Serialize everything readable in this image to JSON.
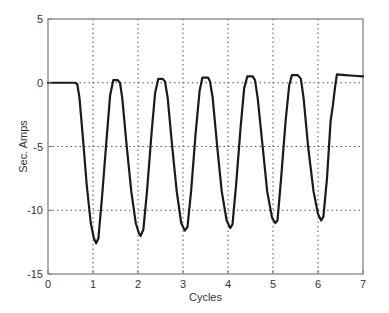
{
  "chart_data": {
    "type": "line",
    "title": "",
    "xlabel": "Cycles",
    "ylabel": "Sec. Amps",
    "xlim": [
      0,
      7
    ],
    "ylim": [
      -15,
      5
    ],
    "xticks": [
      0,
      1,
      2,
      3,
      4,
      5,
      6,
      7
    ],
    "yticks": [
      5,
      0,
      -5,
      -10,
      -15
    ],
    "xtick_labels": [
      "0",
      "1",
      "2",
      "3",
      "4",
      "5",
      "6",
      "7"
    ],
    "ytick_labels": [
      "5",
      "0",
      "-5",
      "-10",
      "-15"
    ],
    "grid": true,
    "grid_style": "dotted",
    "legend": null,
    "series": [
      {
        "name": "Secondary current",
        "color": "#1a1a1a",
        "points": [
          [
            0.0,
            0.0
          ],
          [
            0.6,
            0.0
          ],
          [
            0.65,
            -0.1
          ],
          [
            0.7,
            -1.2
          ],
          [
            0.78,
            -4.5
          ],
          [
            0.86,
            -8.0
          ],
          [
            0.95,
            -11.0
          ],
          [
            1.02,
            -12.2
          ],
          [
            1.07,
            -12.6
          ],
          [
            1.12,
            -12.2
          ],
          [
            1.2,
            -9.0
          ],
          [
            1.3,
            -4.5
          ],
          [
            1.38,
            -1.0
          ],
          [
            1.45,
            0.2
          ],
          [
            1.55,
            0.2
          ],
          [
            1.6,
            0.0
          ],
          [
            1.65,
            -1.2
          ],
          [
            1.75,
            -5.0
          ],
          [
            1.85,
            -8.5
          ],
          [
            1.95,
            -11.0
          ],
          [
            2.02,
            -11.8
          ],
          [
            2.06,
            -12.0
          ],
          [
            2.12,
            -11.5
          ],
          [
            2.2,
            -8.5
          ],
          [
            2.3,
            -4.0
          ],
          [
            2.38,
            -0.8
          ],
          [
            2.45,
            0.3
          ],
          [
            2.55,
            0.3
          ],
          [
            2.6,
            0.1
          ],
          [
            2.66,
            -1.2
          ],
          [
            2.76,
            -5.0
          ],
          [
            2.86,
            -8.5
          ],
          [
            2.96,
            -11.0
          ],
          [
            3.04,
            -11.6
          ],
          [
            3.1,
            -11.3
          ],
          [
            3.18,
            -8.5
          ],
          [
            3.28,
            -4.0
          ],
          [
            3.37,
            -0.6
          ],
          [
            3.43,
            0.4
          ],
          [
            3.56,
            0.4
          ],
          [
            3.6,
            0.1
          ],
          [
            3.66,
            -1.2
          ],
          [
            3.76,
            -5.0
          ],
          [
            3.86,
            -8.5
          ],
          [
            3.97,
            -10.8
          ],
          [
            4.05,
            -11.4
          ],
          [
            4.1,
            -11.1
          ],
          [
            4.18,
            -8.0
          ],
          [
            4.28,
            -3.5
          ],
          [
            4.36,
            -0.4
          ],
          [
            4.43,
            0.5
          ],
          [
            4.55,
            0.5
          ],
          [
            4.6,
            0.2
          ],
          [
            4.66,
            -1.2
          ],
          [
            4.77,
            -5.0
          ],
          [
            4.87,
            -8.5
          ],
          [
            4.98,
            -10.6
          ],
          [
            5.05,
            -11.0
          ],
          [
            5.1,
            -10.8
          ],
          [
            5.18,
            -7.5
          ],
          [
            5.28,
            -3.0
          ],
          [
            5.36,
            -0.2
          ],
          [
            5.42,
            0.6
          ],
          [
            5.55,
            0.6
          ],
          [
            5.62,
            0.3
          ],
          [
            5.68,
            -1.2
          ],
          [
            5.78,
            -5.0
          ],
          [
            5.9,
            -8.5
          ],
          [
            6.0,
            -10.3
          ],
          [
            6.07,
            -10.8
          ],
          [
            6.12,
            -10.5
          ],
          [
            6.2,
            -7.5
          ],
          [
            6.28,
            -3.0
          ],
          [
            6.33,
            -1.8
          ],
          [
            6.38,
            -0.3
          ],
          [
            6.42,
            0.65
          ],
          [
            6.6,
            0.6
          ],
          [
            6.8,
            0.55
          ],
          [
            7.0,
            0.5
          ]
        ]
      }
    ],
    "troughs": [
      {
        "cycle": 1.07,
        "value": -12.6
      },
      {
        "cycle": 2.06,
        "value": -12.0
      },
      {
        "cycle": 3.04,
        "value": -11.6
      },
      {
        "cycle": 4.05,
        "value": -11.4
      },
      {
        "cycle": 5.05,
        "value": -11.0
      },
      {
        "cycle": 6.07,
        "value": -10.8
      }
    ]
  },
  "layout": {
    "plot_left": 48,
    "plot_top": 19,
    "plot_right": 363,
    "plot_bottom": 274
  }
}
